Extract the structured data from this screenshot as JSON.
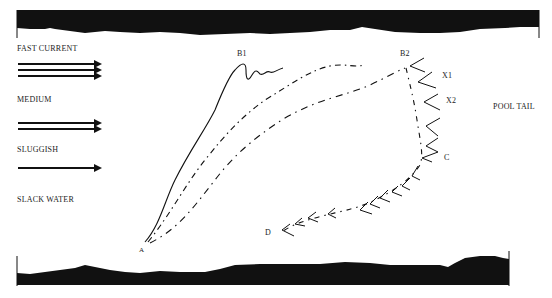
{
  "legend": {
    "fast": "FAST CURRENT",
    "medium": "MEDIUM",
    "sluggish": "SLUGGISH",
    "slack": "SLACK WATER"
  },
  "points": {
    "a": "A",
    "b1": "B1",
    "b2": "B2",
    "x1": "X1",
    "x2": "X2",
    "c": "C",
    "d": "D"
  },
  "region": {
    "pool_tail": "POOL TAIL"
  },
  "colors": {
    "ink": "#111111",
    "paper": "#ffffff"
  }
}
